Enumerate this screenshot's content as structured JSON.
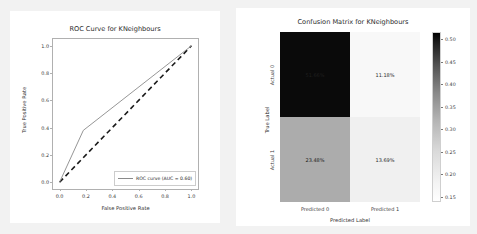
{
  "page": {
    "background": "#f2f2f2",
    "figure_background": "#ffffff"
  },
  "chart_data": [
    {
      "type": "line",
      "id": "roc-curve",
      "title": "ROC Curve for KNeighbours",
      "xlabel": "False Positive Rate",
      "ylabel": "True Positive Rate",
      "xlim": [
        -0.05,
        1.05
      ],
      "ylim": [
        -0.05,
        1.05
      ],
      "xticks": [
        "0.0",
        "0.2",
        "0.4",
        "0.6",
        "0.8",
        "1.0"
      ],
      "xtick_values": [
        0.0,
        0.2,
        0.4,
        0.6,
        0.8,
        1.0
      ],
      "yticks": [
        "0.0",
        "0.2",
        "0.4",
        "0.6",
        "0.8",
        "1.0"
      ],
      "ytick_values": [
        0.0,
        0.2,
        0.4,
        0.6,
        0.8,
        1.0
      ],
      "grid": false,
      "legend_position": "lower right",
      "auc": 0.6,
      "series": [
        {
          "name": "ROC curve (AUC = 0.60)",
          "style": "solid",
          "color": "#8a8a8a",
          "x": [
            0.0,
            0.18,
            1.0
          ],
          "y": [
            0.0,
            0.38,
            1.0
          ]
        },
        {
          "name": "chance-diagonal",
          "style": "dashed",
          "color": "#1a1a1a",
          "x": [
            0.0,
            1.0
          ],
          "y": [
            0.0,
            1.0
          ]
        }
      ]
    },
    {
      "type": "heatmap",
      "id": "confusion-matrix",
      "title": "Confusion Matrix for KNeighbours",
      "xlabel": "Predicted Label",
      "ylabel": "True Label",
      "xticks": [
        "Predicted 0",
        "Predicted 1"
      ],
      "yticks": [
        "Actual 0",
        "Actual 1"
      ],
      "cells": [
        {
          "row": 0,
          "col": 0,
          "label": "51.66%",
          "value": 0.5166,
          "bg": "#0a0a0a",
          "fg": "#1f1f1f"
        },
        {
          "row": 0,
          "col": 1,
          "label": "11.18%",
          "value": 0.1118,
          "bg": "#f8f8f8",
          "fg": "#2b2b2b"
        },
        {
          "row": 1,
          "col": 0,
          "label": "23.48%",
          "value": 0.2348,
          "bg": "#acacac",
          "fg": "#222222"
        },
        {
          "row": 1,
          "col": 1,
          "label": "13.69%",
          "value": 0.1369,
          "bg": "#f0f0f0",
          "fg": "#2b2b2b"
        }
      ],
      "colorbar": {
        "ticks": [
          "0.50",
          "0.45",
          "0.40",
          "0.35",
          "0.30",
          "0.25",
          "0.20",
          "0.15"
        ],
        "tick_values": [
          0.5,
          0.45,
          0.4,
          0.35,
          0.3,
          0.25,
          0.2,
          0.15
        ],
        "vmin": 0.1118,
        "vmax": 0.5166,
        "cmap": "gray_reversed"
      }
    }
  ]
}
